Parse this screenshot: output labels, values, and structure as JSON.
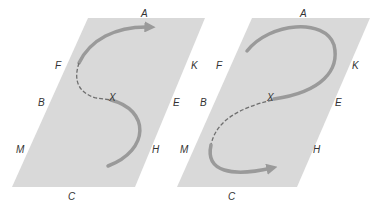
{
  "colors": {
    "plane": "#d9d9d9",
    "path": "#9a9a9a",
    "dashed": "#6f6f6f",
    "label": "#333333",
    "background": "#ffffff"
  },
  "panels": [
    {
      "name": "left",
      "labels": {
        "A": "A",
        "F": "F",
        "B": "B",
        "X": "X",
        "E": "E",
        "K": "K",
        "M": "M",
        "H": "H",
        "C": "C"
      },
      "path_shape": "S-curve from bottom through X (solid), dashed section past F, arrow toward A"
    },
    {
      "name": "right",
      "labels": {
        "A": "A",
        "F": "F",
        "B": "B",
        "X": "X",
        "E": "E",
        "K": "K",
        "M": "M",
        "H": "H",
        "C": "C"
      },
      "path_shape": "loop from near F over A down to X (solid), dashed section toward M, arrow toward H"
    }
  ]
}
